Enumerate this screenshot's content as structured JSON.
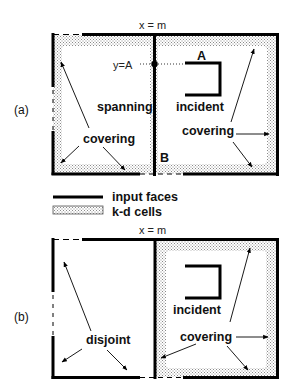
{
  "header_fragment": "",
  "panel_a": {
    "label": "(a)",
    "split_label": "x = m",
    "point_label": "y=A",
    "face_label_A": "A",
    "face_label_B": "B",
    "spanning_label": "spanning",
    "incident_label": "incident",
    "covering_left_label": "covering",
    "covering_right_label": "covering"
  },
  "legend": {
    "input_faces_label": "input faces",
    "kd_cells_label": "k-d cells"
  },
  "panel_b": {
    "label": "(b)",
    "split_label": "x = m",
    "incident_label": "incident",
    "disjoint_label": "disjoint",
    "covering_label": "covering"
  },
  "colors": {
    "line": "#000000",
    "stipple": "#bdbdbd",
    "background": "#ffffff"
  }
}
